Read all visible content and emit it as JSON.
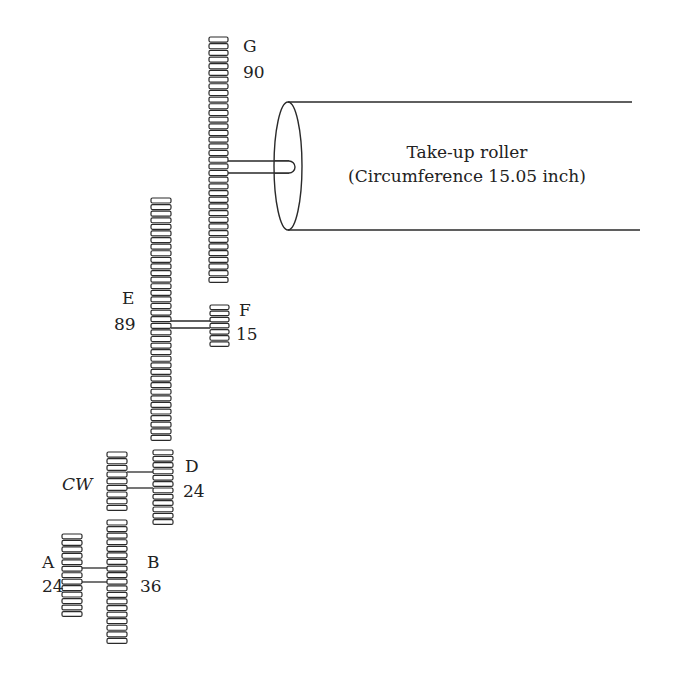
{
  "diagram": {
    "gears": [
      {
        "id": "A",
        "label": "A",
        "teeth": "24",
        "x": 62,
        "y": 534,
        "w": 20,
        "h": 84,
        "label_x": 42,
        "label_y": 568,
        "teeth_x": 42,
        "teeth_y": 592
      },
      {
        "id": "B",
        "label": "B",
        "teeth": "36",
        "x": 107,
        "y": 520,
        "w": 20,
        "h": 125,
        "label_x": 147,
        "label_y": 568,
        "teeth_x": 140,
        "teeth_y": 592
      },
      {
        "id": "CW",
        "label": "CW",
        "teeth": "",
        "x": 107,
        "y": 452,
        "w": 20,
        "h": 60,
        "label_x": 62,
        "label_y": 490,
        "teeth_x": 0,
        "teeth_y": 0
      },
      {
        "id": "D",
        "label": "D",
        "teeth": "24",
        "x": 153,
        "y": 450,
        "w": 20,
        "h": 76,
        "label_x": 185,
        "label_y": 472,
        "teeth_x": 183,
        "teeth_y": 497
      },
      {
        "id": "E",
        "label": "E",
        "teeth": "89",
        "x": 151,
        "y": 198,
        "w": 20,
        "h": 244,
        "label_x": 122,
        "label_y": 304,
        "teeth_x": 114,
        "teeth_y": 330
      },
      {
        "id": "F",
        "label": "F",
        "teeth": "15",
        "x": 210,
        "y": 305,
        "w": 19,
        "h": 43,
        "label_x": 239,
        "label_y": 316,
        "teeth_x": 236,
        "teeth_y": 340
      },
      {
        "id": "G",
        "label": "G",
        "teeth": "90",
        "x": 209,
        "y": 37,
        "w": 19,
        "h": 247,
        "label_x": 243,
        "label_y": 52,
        "teeth_x": 243,
        "teeth_y": 78
      }
    ],
    "shafts": [
      {
        "name": "shaft-a-b",
        "x1": 82,
        "x2": 107,
        "y1": 568,
        "y2": 582
      },
      {
        "name": "shaft-cw-d",
        "x1": 127,
        "x2": 153,
        "y1": 472,
        "y2": 488
      },
      {
        "name": "shaft-e-f",
        "x1": 171,
        "x2": 210,
        "y1": 321,
        "y2": 328
      }
    ],
    "roller": {
      "title": "Take-up roller",
      "subtitle": "(Circumference 15.05 inch)",
      "ellipse_cx": 288,
      "ellipse_cy": 166,
      "ellipse_rx": 14,
      "ellipse_ry": 64,
      "top_end_x": 632,
      "bottom_end_x": 640,
      "shaft_y1": 161,
      "shaft_y2": 173,
      "shaft_x1": 228,
      "shaft_x2": 295
    },
    "colors": {
      "stroke": "#2a2a2a",
      "text": "#222222",
      "background": "#ffffff"
    }
  }
}
